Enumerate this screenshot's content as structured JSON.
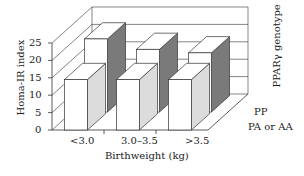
{
  "chart_data": {
    "type": "bar",
    "subtype": "3d-grouped-bar",
    "title": "",
    "xlabel": "Birthweight (kg)",
    "ylabel": "Homa-IR index",
    "zlabel": "PPARγ genotype",
    "categories": [
      "<3.0",
      "3.0–3.5",
      ">3.5"
    ],
    "series": [
      {
        "name": "PA or AA",
        "values": [
          14.5,
          14.5,
          14.5
        ],
        "color": "#ffffff",
        "side_color": "#dcdcdc"
      },
      {
        "name": "PP",
        "values": [
          21,
          18,
          17
        ],
        "color": "#ffffff",
        "side_color": "#7a7a7a"
      }
    ],
    "yticks": [
      "0",
      "5",
      "10",
      "15",
      "20",
      "25"
    ],
    "ylim": [
      0,
      25
    ],
    "grid": true,
    "legend_position": "depth-axis-right"
  }
}
